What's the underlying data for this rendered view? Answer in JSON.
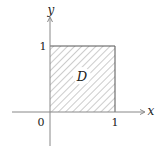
{
  "diagram": {
    "region_label": "D",
    "x_axis_label": "x",
    "y_axis_label": "y",
    "origin_label": "0",
    "x_tick_label": "1",
    "y_tick_label": "1",
    "region": {
      "x_range": [
        0,
        1
      ],
      "y_range": [
        0,
        1
      ],
      "fill": "hatched"
    },
    "colors": {
      "axis": "#888888",
      "hatch": "#9a9a9a",
      "text": "#222222",
      "square_edge": "#555555"
    }
  }
}
